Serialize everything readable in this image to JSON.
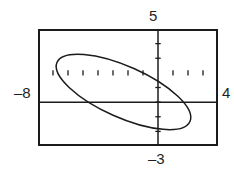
{
  "item_label": ")",
  "window": {
    "xmin_label": "–8",
    "xmax_label": "4",
    "ymin_label": "–3",
    "ymax_label": "5"
  },
  "chart_data": {
    "type": "line",
    "title": "",
    "xlabel": "",
    "ylabel": "",
    "xlim": [
      -8,
      4
    ],
    "ylim": [
      -3,
      5
    ],
    "xscl": 1,
    "yscl": 1,
    "grid": false,
    "legend": "none",
    "axes": {
      "x_axis_at_y": 0,
      "y_axis_at_x": 0,
      "tick_marks": true,
      "x_ticks": [
        -7,
        -6,
        -5,
        -4,
        -3,
        -2,
        -1,
        1,
        2,
        3
      ],
      "y_ticks": [
        -2,
        -1,
        1,
        2,
        3,
        4
      ]
    },
    "annotations": [
      "Top of viewing window labeled 5 (Ymax)",
      "Bottom of viewing window labeled -3 (Ymin)",
      "Left of viewing window labeled -8 (Xmin)",
      "Right of viewing window labeled 4 (Xmax)"
    ],
    "series": [
      {
        "name": "rotated ellipse",
        "shape": "ellipse",
        "closed": true,
        "center": [
          -2.3,
          0.7
        ],
        "semi_major": 4.85,
        "semi_minor": 1.75,
        "rotation_deg": -24,
        "x_intercepts": [
          -4.2,
          2.7
        ],
        "y_intercepts": [
          -1.45,
          2.35
        ],
        "x_extent": [
          -6.9,
          2.55
        ],
        "y_extent": [
          -1.55,
          2.95
        ]
      }
    ]
  }
}
